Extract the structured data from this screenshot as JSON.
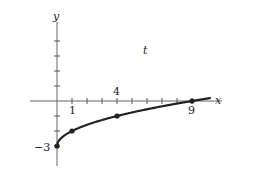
{
  "chart_data": {
    "type": "line",
    "title": "",
    "xlabel": "x",
    "ylabel": "y",
    "annotation": "t",
    "x": [
      0,
      1,
      4,
      9
    ],
    "series": [
      {
        "name": "y = √x − 3",
        "values": [
          -3,
          -2,
          -1,
          0
        ]
      }
    ],
    "marked_points": [
      [
        0,
        -3
      ],
      [
        1,
        -2
      ],
      [
        4,
        -1
      ],
      [
        9,
        0
      ]
    ],
    "tick_labels": {
      "x": [
        "1",
        "4",
        "9"
      ],
      "y": [
        "−3"
      ]
    },
    "xlim": [
      -2,
      10.5
    ],
    "ylim": [
      -4.2,
      5.5
    ],
    "grid": false
  },
  "labels": {
    "x_axis": "x",
    "y_axis": "y",
    "annotation": "t",
    "tick_1": "1",
    "tick_4": "4",
    "tick_9": "9",
    "tick_neg3": "−3"
  },
  "colors": {
    "curve": "#222222",
    "axis": "#555555"
  }
}
